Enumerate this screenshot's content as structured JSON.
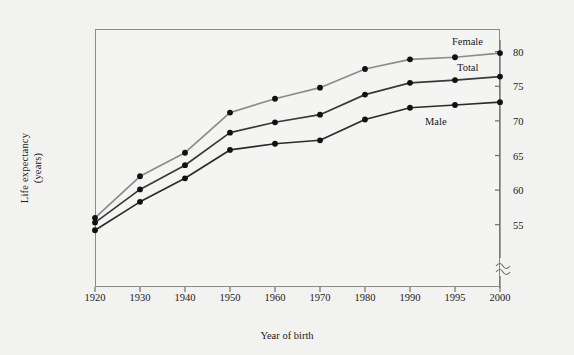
{
  "figure": {
    "xlabel": "Year of birth",
    "ylabel_line1": "Life expectancy",
    "ylabel_line2": "(years)",
    "background": "#f2f2f0",
    "frame_color": "#8a8a8a"
  },
  "chart_data": {
    "type": "line",
    "title": "",
    "xlabel": "Year of birth",
    "ylabel": "Life expectancy (years)",
    "categories": [
      "1920",
      "1930",
      "1940",
      "1950",
      "1960",
      "1970",
      "1980",
      "1990",
      "1995",
      "2000"
    ],
    "ylim": [
      53,
      81.5
    ],
    "yticks": [
      55,
      60,
      65,
      70,
      75,
      80
    ],
    "ytick_labels": [
      "55",
      "60",
      "65",
      "70",
      "75",
      "80"
    ],
    "axis_break": true,
    "grid": false,
    "legend": "inline-right",
    "series": [
      {
        "name": "Female",
        "color": "#8c8c8c",
        "values": [
          56.0,
          62.0,
          65.4,
          71.2,
          73.2,
          74.8,
          77.5,
          78.9,
          79.2,
          79.8
        ]
      },
      {
        "name": "Total",
        "color": "#3a3a3a",
        "values": [
          55.3,
          60.1,
          63.6,
          68.3,
          69.8,
          70.9,
          73.8,
          75.5,
          75.9,
          76.4
        ]
      },
      {
        "name": "Male",
        "color": "#2b2b2b",
        "values": [
          54.2,
          58.3,
          61.7,
          65.8,
          66.7,
          67.2,
          70.2,
          71.9,
          72.3,
          72.7
        ]
      }
    ],
    "series_label_positions": [
      {
        "name": "Female",
        "x": 452,
        "y": 36
      },
      {
        "name": "Total",
        "x": 457,
        "y": 62
      },
      {
        "name": "Male",
        "x": 425,
        "y": 116
      }
    ]
  }
}
